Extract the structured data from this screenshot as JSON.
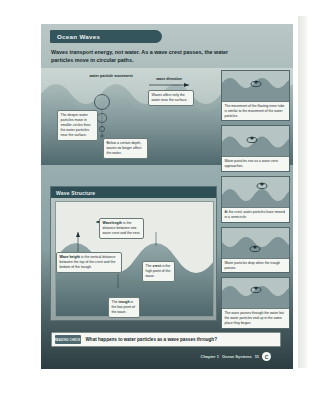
{
  "document": {
    "title_tab": "Ocean Waves",
    "intro": "Waves transport energy, not water. As a wave crest passes, the water particles move in circular paths."
  },
  "top_illustration": {
    "label_particle_movement": "water particle movement",
    "label_wave_direction": "wave direction",
    "callout_surface": "Waves affect only the water near the surface.",
    "callout_deeper": "The deeper water particles move in smaller circles than the water particles near the surface.",
    "callout_depth": "Below a certain depth, waves no longer affect the water."
  },
  "wave_structure": {
    "heading": "Wave Structure",
    "wavelength_term": "Wavelength",
    "wavelength_text": " is the distance between one wave crest and the next.",
    "wave_height_term": "Wave height",
    "wave_height_text": " is the vertical distance between the top of the crest and the bottom of the trough.",
    "crest_pre": "The ",
    "crest_term": "crest",
    "crest_text": " is the high point of the wave.",
    "trough_pre": "The ",
    "trough_term": "trough",
    "trough_text": " is the low point of the wave."
  },
  "sequence_panels": [
    {
      "caption": "The movement of the floating inner tube is similar to the movement of the water particles."
    },
    {
      "caption": "Water particles rise as a wave crest approaches."
    },
    {
      "caption": "At the crest, water particles have moved in a semicircle."
    },
    {
      "caption": "Water particles drop when the trough passes."
    },
    {
      "caption": "The wave passes through the water but the water particles end up in the same place they began."
    }
  ],
  "question_bar": {
    "tag": "READING CHECK",
    "question": "What happens to water particles as a wave passes through?"
  },
  "footer": {
    "chapter": "Chapter 1",
    "section": "Ocean Systems",
    "page": "11",
    "badge": "C"
  },
  "colors": {
    "header_teal": "#2f4f57",
    "panel_top": "#b9c7c6",
    "deep_water": "#3c5054",
    "callout_bg": "#f4f6f2"
  }
}
